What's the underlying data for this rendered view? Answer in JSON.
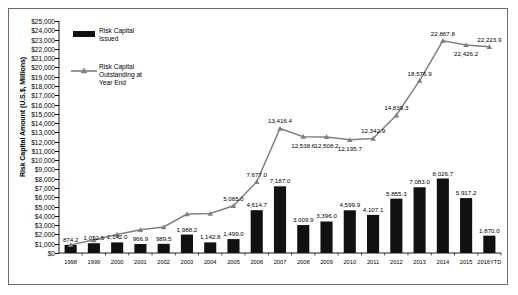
{
  "chart_data": {
    "type": "bar",
    "title": "",
    "xlabel": "",
    "ylabel": "Risk Capital Amount (U.S.$, Millions)",
    "ylim": [
      0,
      25000
    ],
    "ytick_step": 1000,
    "grid": false,
    "legend_position": "upper-left",
    "categories": [
      "1998",
      "1999",
      "2000",
      "2001",
      "2002",
      "2003",
      "2004",
      "2005",
      "2006",
      "2007",
      "2008",
      "2009",
      "2010",
      "2011",
      "2012",
      "2013",
      "2014",
      "2015",
      "2016YTD"
    ],
    "ytick_labels": [
      "$0",
      "$1,000",
      "$2,000",
      "$3,000",
      "$4,000",
      "$5,000",
      "$6,000",
      "$7,000",
      "$8,000",
      "$9,000",
      "$10,000",
      "$11,000",
      "$12,000",
      "$13,000",
      "$14,000",
      "$15,000",
      "$16,000",
      "$17,000",
      "$18,000",
      "$19,000",
      "$20,000",
      "$21,000",
      "$22,000",
      "$23,000",
      "$24,000",
      "$25,000"
    ],
    "series": [
      {
        "name": "Risk Capital Issued",
        "type": "bar",
        "color": "#111111",
        "values": [
          874.2,
          1052.5,
          1142.0,
          966.9,
          989.5,
          1988.2,
          1142.8,
          1499.0,
          4614.7,
          7187.0,
          3009.9,
          3396.0,
          4599.9,
          4107.1,
          5855.3,
          7083.0,
          8026.7,
          5917.2,
          1870.0
        ],
        "labels": [
          "874.2",
          "1,052.5",
          "1,142.0",
          "966.9",
          "989.5",
          "1,988.2",
          "1,142.8",
          "1,499.0",
          "4,614.7",
          "7,187.0",
          "3,009.9",
          "3,396.0",
          "4,599.9",
          "4,107.1",
          "5,855.3",
          "7,083.0",
          "8,026.7",
          "5,917.2",
          "1,870.0"
        ]
      },
      {
        "name": "Risk Capital Outstanding at Year End",
        "type": "line",
        "color": "#808080",
        "marker": "triangle",
        "values": [
          874.2,
          1400.0,
          2000.0,
          2500.0,
          2800.0,
          4200.0,
          4250.0,
          5085.0,
          7677.0,
          13416.4,
          12538.6,
          12508.2,
          12195.7,
          12342.9,
          14839.3,
          18576.9,
          22867.8,
          22426.2,
          22223.9
        ],
        "labels": [
          "",
          "",
          "",
          "",
          "",
          "",
          "",
          "5,085.0",
          "7,677.0",
          "13,416.4",
          "12,538.6",
          "12,508.2",
          "12,195.7",
          "12,342.9",
          "14,839.3",
          "18,576.9",
          "22,867.8",
          "22,426.2",
          "22,223.9"
        ]
      }
    ]
  },
  "legend": {
    "bar_label": "Risk Capital\nIssued",
    "line_label": "Risk Capital\nOutstanding at\nYear End"
  }
}
